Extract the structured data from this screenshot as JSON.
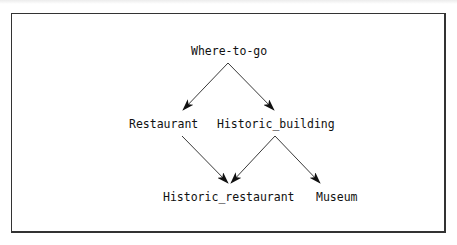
{
  "diagram": {
    "type": "directed-acyclic-graph",
    "nodes": {
      "root": "Where-to-go",
      "restaurant": "Restaurant",
      "historic_building": "Historic_building",
      "historic_restaurant": "Historic_restaurant",
      "museum": "Museum"
    },
    "edges": [
      {
        "from": "Where-to-go",
        "to": "Restaurant"
      },
      {
        "from": "Where-to-go",
        "to": "Historic_building"
      },
      {
        "from": "Restaurant",
        "to": "Historic_restaurant"
      },
      {
        "from": "Historic_building",
        "to": "Historic_restaurant"
      },
      {
        "from": "Historic_building",
        "to": "Museum"
      }
    ],
    "colors": {
      "line": "#222222",
      "text": "#111111",
      "border": "#333333",
      "background": "#ffffff"
    }
  }
}
